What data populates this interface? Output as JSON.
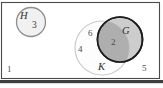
{
  "diagram": {
    "type": "venn-diagram",
    "title": "",
    "universe": {
      "name": "universal-set-rectangle",
      "outside_count": "1",
      "corner_count_right": "5"
    },
    "sets": [
      {
        "id": "H",
        "label": "H",
        "count": "3",
        "fill": "#f2f2f2",
        "stroke": "#8c8c8c",
        "shaded": false
      },
      {
        "id": "K",
        "label": "K",
        "count_only_upper": "6",
        "count_only_lower": "4",
        "fill": "#fcfcfc",
        "stroke": "#c9c9c9",
        "shaded": false
      },
      {
        "id": "G",
        "label": "G",
        "fill": "#c8c8c8",
        "stroke": "#1c1c1c",
        "shaded": true
      }
    ],
    "intersection": {
      "name": "G-and-K",
      "count": "2",
      "fill": "#a9a9a9"
    },
    "colors": {
      "background": "#ffffff",
      "frame": "#3a3a3a",
      "text": "#3a3a3a"
    }
  }
}
